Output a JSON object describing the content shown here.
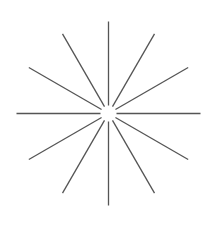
{
  "diagram": {
    "type": "starburst",
    "center": [
      108.5,
      113.5
    ],
    "inner_radius": 8,
    "outer_radius": 92,
    "ray_count": 12,
    "ray_angles_deg": [
      0,
      30,
      60,
      90,
      120,
      150,
      180,
      210,
      240,
      270,
      300,
      330
    ],
    "ray_color": "#555555",
    "ray_width": 1.3,
    "background": "#ffffff"
  }
}
